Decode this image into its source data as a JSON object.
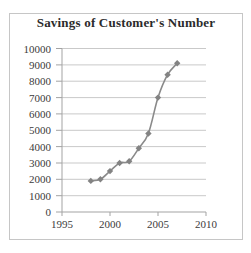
{
  "page": {
    "background": "#ffffff",
    "frame_border_color": "#c6c6c6"
  },
  "chart_data": {
    "type": "line",
    "title": "Savings of Customer's Number",
    "xlabel": "",
    "ylabel": "",
    "x": [
      1998,
      1999,
      2000,
      2001,
      2002,
      2003,
      2004,
      2005,
      2006,
      2007
    ],
    "values": [
      1900,
      2000,
      2500,
      3000,
      3100,
      3900,
      4800,
      7000,
      8400,
      9100
    ],
    "xlim": [
      1995,
      2010
    ],
    "ylim": [
      0,
      10000
    ],
    "x_ticks": [
      1995,
      2000,
      2005,
      2010
    ],
    "y_ticks": [
      0,
      1000,
      2000,
      3000,
      4000,
      5000,
      6000,
      7000,
      8000,
      9000,
      10000
    ],
    "grid": "horizontal",
    "legend": false,
    "marker": "diamond",
    "smooth_line": true,
    "colors": {
      "line": "#8a8a8a",
      "marker": "#838383",
      "gridline": "#c9c9c9",
      "axis": "#a3a3a3",
      "tick_label": "#3b3b3b",
      "title": "#2b2b2b"
    }
  }
}
